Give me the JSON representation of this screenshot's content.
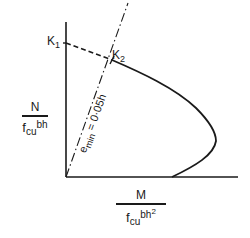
{
  "diagram": {
    "type": "interaction-diagram",
    "colors": {
      "ink": "#1a1a1a",
      "background": "#ffffff"
    },
    "y_axis": {
      "numerator": "N",
      "denominator_main": "f",
      "denominator_sub": "cu",
      "denominator_tail": "bh"
    },
    "x_axis": {
      "numerator": "M",
      "denominator_main": "f",
      "denominator_sub": "cu",
      "denominator_tail": "bh",
      "denominator_sup": "2"
    },
    "points": [
      {
        "label_main": "K",
        "label_sub": "1"
      },
      {
        "label_main": "K",
        "label_sub": "2"
      }
    ],
    "eccentricity_line": {
      "prefix": "e",
      "sub": "min",
      "suffix": " = 0·05h"
    }
  }
}
